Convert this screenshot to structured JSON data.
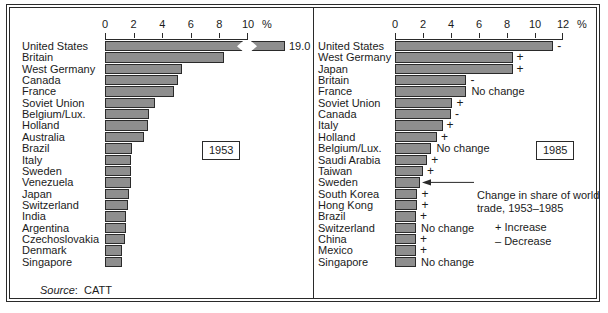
{
  "figure": {
    "source_label": "Source",
    "source_value": "CATT",
    "percent_symbol": "%"
  },
  "left": {
    "year_badge": "1953",
    "axis": {
      "ticks": [
        0,
        2,
        4,
        6,
        8,
        10
      ],
      "tick_labels": [
        "0",
        "2",
        "4",
        "6",
        "8",
        "10"
      ],
      "max": 10,
      "unit": "%"
    },
    "break_value_label": "19.0",
    "rows": [
      {
        "label": "United States",
        "value": 19.0,
        "broken": true
      },
      {
        "label": "Britain",
        "value": 8.3
      },
      {
        "label": "West Germany",
        "value": 5.4
      },
      {
        "label": "Canada",
        "value": 5.1
      },
      {
        "label": "France",
        "value": 4.8
      },
      {
        "label": "Soviet Union",
        "value": 3.5
      },
      {
        "label": "Belgium/Lux.",
        "value": 3.1
      },
      {
        "label": "Holland",
        "value": 3.0
      },
      {
        "label": "Australia",
        "value": 2.7
      },
      {
        "label": "Brazil",
        "value": 1.9
      },
      {
        "label": "Italy",
        "value": 1.8
      },
      {
        "label": "Sweden",
        "value": 1.8
      },
      {
        "label": "Venezuela",
        "value": 1.8
      },
      {
        "label": "Japan",
        "value": 1.7
      },
      {
        "label": "Switzerland",
        "value": 1.6
      },
      {
        "label": "India",
        "value": 1.5
      },
      {
        "label": "Argentina",
        "value": 1.5
      },
      {
        "label": "Czechoslovakia",
        "value": 1.4
      },
      {
        "label": "Denmark",
        "value": 1.2
      },
      {
        "label": "Singapore",
        "value": 1.2
      }
    ]
  },
  "right": {
    "year_badge": "1985",
    "axis": {
      "ticks": [
        0,
        2,
        4,
        6,
        8,
        10,
        12
      ],
      "tick_labels": [
        "0",
        "2",
        "4",
        "6",
        "8",
        "10",
        "12"
      ],
      "max": 12,
      "unit": "%"
    },
    "rows": [
      {
        "label": "United States",
        "value": 11.3,
        "change": "-"
      },
      {
        "label": "West Germany",
        "value": 8.4,
        "change": "+"
      },
      {
        "label": "Japan",
        "value": 8.4,
        "change": "+"
      },
      {
        "label": "Britain",
        "value": 5.1,
        "change": "-"
      },
      {
        "label": "France",
        "value": 5.1,
        "change": "No change"
      },
      {
        "label": "Soviet Union",
        "value": 4.1,
        "change": "+"
      },
      {
        "label": "Canada",
        "value": 4.0,
        "change": "-"
      },
      {
        "label": "Italy",
        "value": 3.4,
        "change": "+"
      },
      {
        "label": "Holland",
        "value": 3.0,
        "change": "+"
      },
      {
        "label": "Belgium/Lux.",
        "value": 2.6,
        "change": "No change"
      },
      {
        "label": "Saudi Arabia",
        "value": 2.3,
        "change": "+"
      },
      {
        "label": "Taiwan",
        "value": 2.0,
        "change": "+"
      },
      {
        "label": "Sweden",
        "value": 1.8,
        "change": "-"
      },
      {
        "label": "South Korea",
        "value": 1.6,
        "change": "+"
      },
      {
        "label": "Hong Kong",
        "value": 1.6,
        "change": "+"
      },
      {
        "label": "Brazil",
        "value": 1.5,
        "change": "+"
      },
      {
        "label": "Switzerland",
        "value": 1.5,
        "change": "No change"
      },
      {
        "label": "China",
        "value": 1.5,
        "change": "+"
      },
      {
        "label": "Mexico",
        "value": 1.5,
        "change": "+"
      },
      {
        "label": "Singapore",
        "value": 1.5,
        "change": "No change"
      }
    ],
    "callout": {
      "line1": "Change in share of world",
      "line2": "trade, 1953–1985"
    },
    "legend": {
      "increase": "+ Increase",
      "decrease": "– Decrease"
    }
  },
  "chart_data": [
    {
      "type": "bar",
      "title": "Share of world trade, 1953",
      "orientation": "horizontal",
      "xlabel": "%",
      "ylabel": "",
      "xlim": [
        0,
        10
      ],
      "grid": false,
      "note": "United States bar is axis-broken; true value 19.0",
      "categories": [
        "United States",
        "Britain",
        "West Germany",
        "Canada",
        "France",
        "Soviet Union",
        "Belgium/Lux.",
        "Holland",
        "Australia",
        "Brazil",
        "Italy",
        "Sweden",
        "Venezuela",
        "Japan",
        "Switzerland",
        "India",
        "Argentina",
        "Czechoslovakia",
        "Denmark",
        "Singapore"
      ],
      "values": [
        19.0,
        8.3,
        5.4,
        5.1,
        4.8,
        3.5,
        3.1,
        3.0,
        2.7,
        1.9,
        1.8,
        1.8,
        1.8,
        1.7,
        1.6,
        1.5,
        1.5,
        1.4,
        1.2,
        1.2
      ]
    },
    {
      "type": "bar",
      "title": "Share of world trade, 1985",
      "orientation": "horizontal",
      "xlabel": "%",
      "ylabel": "",
      "xlim": [
        0,
        12
      ],
      "grid": false,
      "categories": [
        "United States",
        "West Germany",
        "Japan",
        "Britain",
        "France",
        "Soviet Union",
        "Canada",
        "Italy",
        "Holland",
        "Belgium/Lux.",
        "Saudi Arabia",
        "Taiwan",
        "Sweden",
        "South Korea",
        "Hong Kong",
        "Brazil",
        "Switzerland",
        "China",
        "Mexico",
        "Singapore"
      ],
      "values": [
        11.3,
        8.4,
        8.4,
        5.1,
        5.1,
        4.1,
        4.0,
        3.4,
        3.0,
        2.6,
        2.3,
        2.0,
        1.8,
        1.6,
        1.6,
        1.5,
        1.5,
        1.5,
        1.5,
        1.5
      ],
      "annotations": [
        "-",
        "+",
        "+",
        "-",
        "No change",
        "+",
        "-",
        "+",
        "+",
        "No change",
        "+",
        "+",
        "-",
        "+",
        "+",
        "+",
        "No change",
        "+",
        "+",
        "No change"
      ]
    }
  ]
}
